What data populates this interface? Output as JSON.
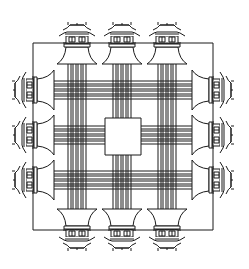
{
  "diagram": {
    "type": "architectural-plan",
    "stroke_color": "#1a1a1a",
    "background": "#ffffff",
    "outer_square": {
      "x": 33,
      "y": 43,
      "w": 180,
      "h": 187
    },
    "center_square": {
      "x": 105,
      "y": 118,
      "w": 36,
      "h": 37
    },
    "gates": {
      "top": [
        77,
        122,
        167
      ],
      "bottom": [
        77,
        122,
        167
      ],
      "left": [
        90,
        135,
        180
      ],
      "right": [
        90,
        135,
        180
      ]
    },
    "lines_per_gate": 4
  }
}
